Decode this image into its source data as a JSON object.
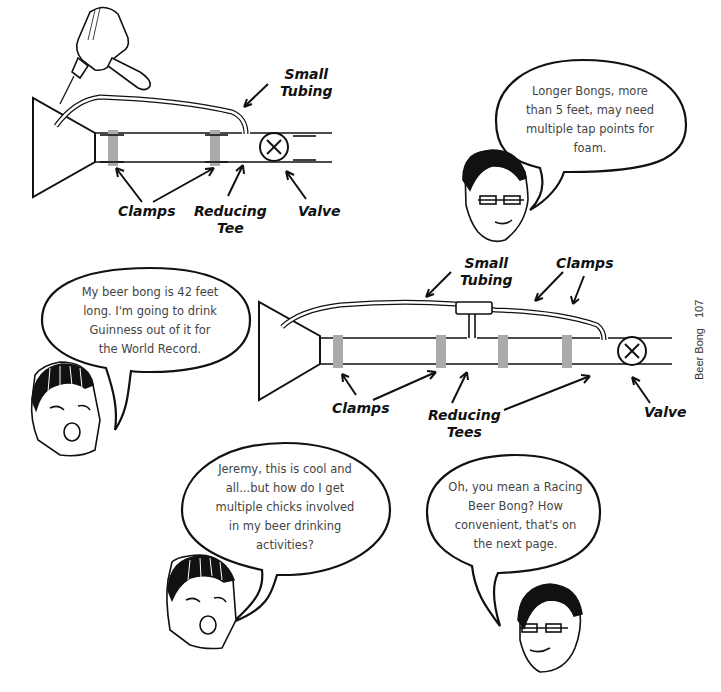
{
  "page": {
    "section_title": "Beer Bong",
    "page_number": "107"
  },
  "diagram_top": {
    "labels": {
      "small_tubing_1": "Small",
      "small_tubing_2": "Tubing",
      "clamps": "Clamps",
      "reducing_tee_1": "Reducing",
      "reducing_tee_2": "Tee",
      "valve": "Valve"
    }
  },
  "diagram_bottom": {
    "labels": {
      "small_tubing_1": "Small",
      "small_tubing_2": "Tubing",
      "clamps_top": "Clamps",
      "clamps_bottom": "Clamps",
      "reducing_tees_1": "Reducing",
      "reducing_tees_2": "Tees",
      "valve": "Valve"
    }
  },
  "speech_bubbles": [
    {
      "speaker": "glasses-guy",
      "lines": [
        "Longer Bongs, more",
        "than 5 feet, may need",
        "multiple tap points for",
        "foam."
      ]
    },
    {
      "speaker": "bandana-guy",
      "lines": [
        "My beer bong is 42 feet",
        "long. I'm going to drink",
        "Guinness out of it for",
        "the World Record."
      ]
    },
    {
      "speaker": "bandana-guy",
      "lines": [
        "Jeremy, this is cool and",
        "all...but how do I get",
        "multiple chicks involved",
        "in my beer drinking",
        "activities?"
      ]
    },
    {
      "speaker": "glasses-guy",
      "lines": [
        "Oh, you mean a Racing",
        "Beer Bong? How",
        "convenient, that's on",
        "the next page."
      ]
    }
  ]
}
